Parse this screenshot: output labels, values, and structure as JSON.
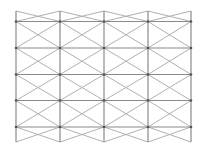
{
  "diagram": {
    "type": "triangular-lattice-grid",
    "columns": 4,
    "rows": 4,
    "colors": {
      "grid": "#8a8a8a",
      "diagonal": "#b0b0b0",
      "node": "#555555",
      "background": "#ffffff"
    }
  }
}
